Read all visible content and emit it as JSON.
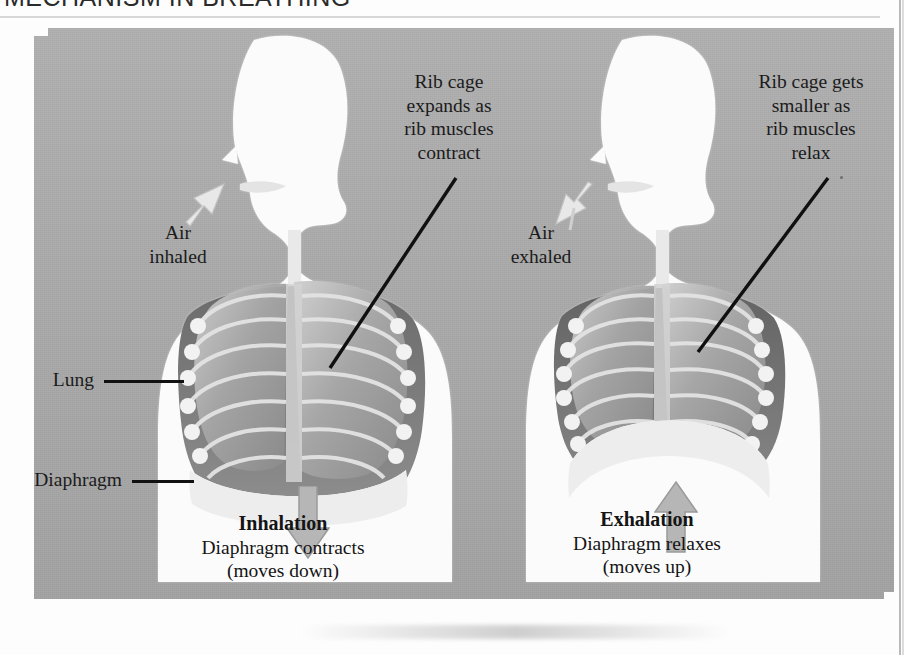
{
  "heading": "MECHANISM IN BREATHING",
  "colors": {
    "panel_gray": "#acacac",
    "page_white": "#fdfdfd",
    "ink": "#1b1b1b",
    "bone": "#d9d9d9",
    "lung": "#9a9a9a",
    "cavity": "#6d6d6d"
  },
  "figures": [
    {
      "id": "inhalation",
      "air_label": "Air\ninhaled",
      "air_label_line1": "Air",
      "air_label_line2": "inhaled",
      "ribcage_note_lines": [
        "Rib cage",
        "expands as",
        "rib muscles",
        "contract"
      ],
      "caption_title": "Inhalation",
      "caption_line1": "Diaphragm contracts",
      "caption_line2": "(moves down)",
      "diaphragm_arrow": "arrow-down",
      "air_arrow": "arrow-in"
    },
    {
      "id": "exhalation",
      "air_label_line1": "Air",
      "air_label_line2": "exhaled",
      "ribcage_note_lines": [
        "Rib cage gets",
        "smaller as",
        "rib muscles",
        "relax"
      ],
      "caption_title": "Exhalation",
      "caption_line1": "Diaphragm relaxes",
      "caption_line2": "(moves up)",
      "diaphragm_arrow": "arrow-up",
      "air_arrow": "arrow-out"
    }
  ],
  "part_labels": [
    {
      "id": "lung",
      "text": "Lung"
    },
    {
      "id": "diaphragm",
      "text": "Diaphragm"
    }
  ]
}
